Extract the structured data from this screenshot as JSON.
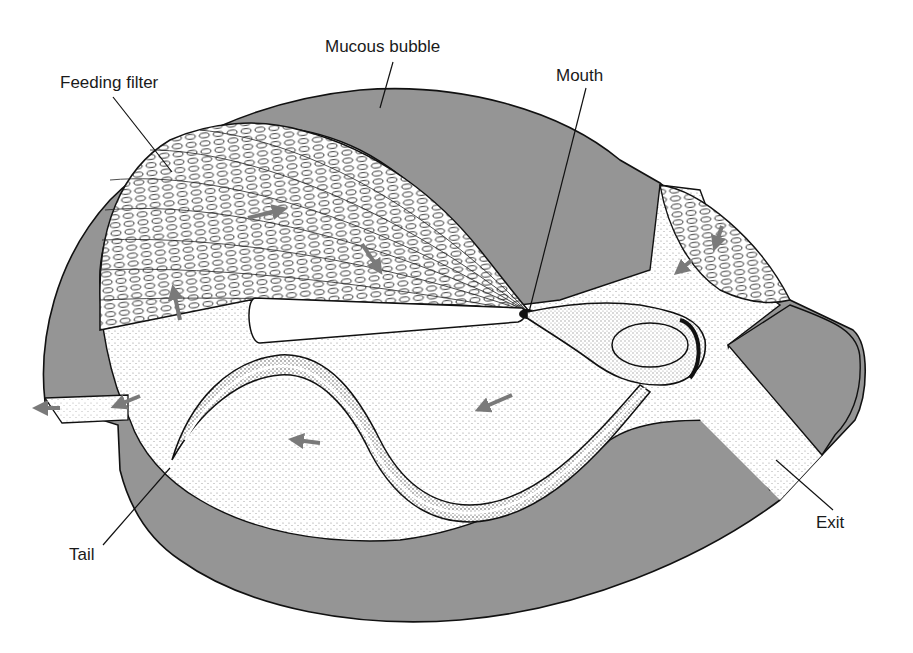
{
  "diagram": {
    "type": "anatomical illustration",
    "colors": {
      "house_wall": "#959595",
      "outline": "#111111",
      "flow_arrow": "#7a7a7a",
      "background": "#ffffff",
      "stipple": "#222222"
    },
    "labels": [
      {
        "id": "mucous-bubble",
        "text": "Mucous bubble",
        "x": 325,
        "y": 38
      },
      {
        "id": "feeding-filter",
        "text": "Feeding filter",
        "x": 60,
        "y": 74
      },
      {
        "id": "mouth",
        "text": "Mouth",
        "x": 556,
        "y": 67
      },
      {
        "id": "tail",
        "text": "Tail",
        "x": 69,
        "y": 546
      },
      {
        "id": "exit",
        "text": "Exit",
        "x": 816,
        "y": 514
      }
    ],
    "flow_arrows_count": 9
  }
}
